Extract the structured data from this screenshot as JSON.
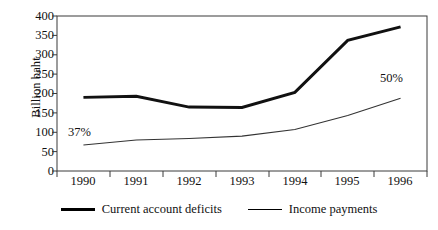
{
  "chart_data": {
    "type": "line",
    "title": "",
    "xlabel": "",
    "ylabel": "Billion baht",
    "categories": [
      "1990",
      "1991",
      "1992",
      "1993",
      "1994",
      "1995",
      "1996"
    ],
    "ylim": [
      0,
      400
    ],
    "ytick_labels": [
      "0",
      "50",
      "100",
      "150",
      "200",
      "250",
      "300",
      "350",
      "400"
    ],
    "ytick_values": [
      0,
      50,
      100,
      150,
      200,
      250,
      300,
      350,
      400
    ],
    "grid": false,
    "legend_position": "bottom",
    "series": [
      {
        "name": "Current account deficits",
        "style": "thick",
        "values": [
          190,
          193,
          165,
          164,
          203,
          337,
          372
        ]
      },
      {
        "name": "Income payments",
        "style": "thin",
        "values": [
          67,
          80,
          84,
          90,
          107,
          143,
          188
        ]
      }
    ],
    "annotations": [
      {
        "text": "37%",
        "x": "1990",
        "value": 110
      },
      {
        "text": "50%",
        "x": "1996",
        "value": 258
      }
    ]
  },
  "axis": {
    "y_title": "Billion baht"
  },
  "legend": {
    "items": [
      {
        "label": "Current account deficits",
        "swatch": "thick-line-swatch"
      },
      {
        "label": "Income payments",
        "swatch": "thin-line-swatch"
      }
    ]
  }
}
